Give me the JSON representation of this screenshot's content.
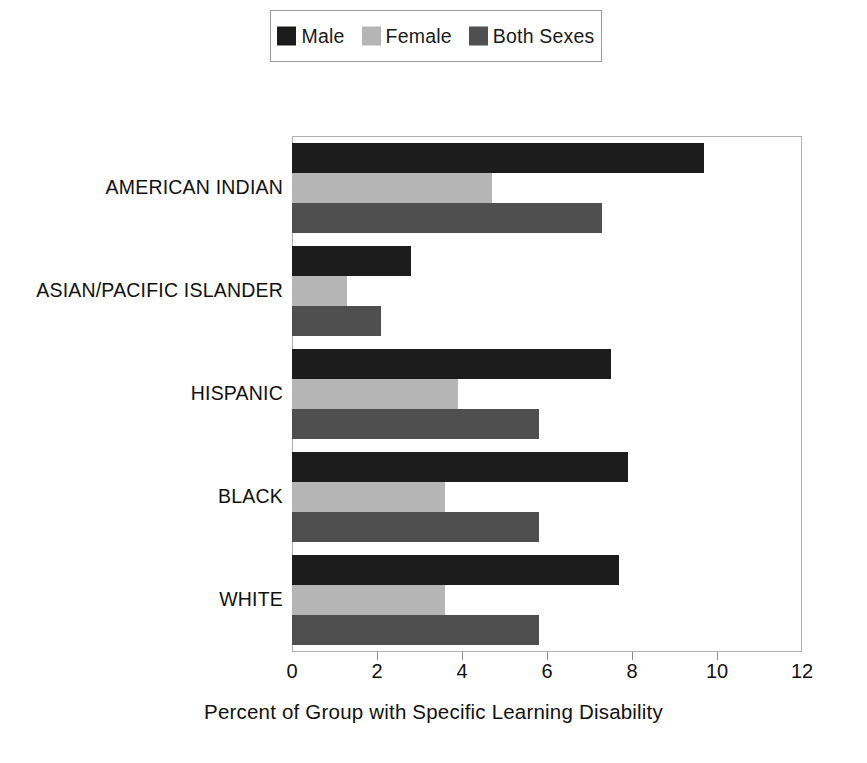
{
  "chart_data": {
    "type": "bar",
    "orientation": "horizontal",
    "title": "",
    "subtitle": "",
    "xlabel": "Percent of Group with Specific Learning Disability",
    "ylabel": "",
    "xlim": [
      0,
      12
    ],
    "xticks": [
      0,
      2,
      4,
      6,
      8,
      10,
      12
    ],
    "xtick_labels": [
      "0",
      "2",
      "4",
      "6",
      "8",
      "10",
      "12"
    ],
    "grid": false,
    "legend_position": "top-center",
    "categories": [
      "AMERICAN INDIAN",
      "ASIAN/PACIFIC ISLANDER",
      "HISPANIC",
      "BLACK",
      "WHITE"
    ],
    "series": [
      {
        "name": "Male",
        "color": "#1c1c1c",
        "values": [
          9.7,
          2.8,
          7.5,
          7.9,
          7.7
        ]
      },
      {
        "name": "Female",
        "color": "#b5b5b5",
        "values": [
          4.7,
          1.3,
          3.9,
          3.6,
          3.6
        ]
      },
      {
        "name": "Both Sexes",
        "color": "#4f4f4f",
        "values": [
          7.3,
          2.1,
          5.8,
          5.8,
          5.8
        ]
      }
    ]
  },
  "legend": {
    "entries": [
      {
        "label": "Male",
        "swatch": "legend-swatch-male"
      },
      {
        "label": "Female",
        "swatch": "legend-swatch-female"
      },
      {
        "label": "Both Sexes",
        "swatch": "legend-swatch-both-sexes"
      }
    ]
  },
  "colors": {
    "male": "#1c1c1c",
    "female": "#b5b5b5",
    "both_sexes": "#4f4f4f",
    "frame": "#b0b0b0",
    "text": "#111111"
  }
}
